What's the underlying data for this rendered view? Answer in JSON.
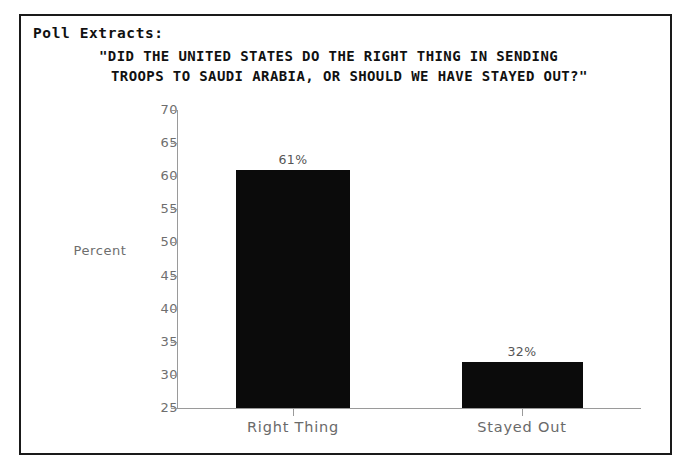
{
  "document": {
    "section_label": "Poll Extracts:",
    "question_line_1": "\"DID THE UNITED STATES DO THE RIGHT THING IN SENDING",
    "question_line_2": "TROOPS TO SAUDI ARABIA, OR SHOULD WE HAVE STAYED OUT?\""
  },
  "chart_data": {
    "type": "bar",
    "title": "\"DID THE UNITED STATES DO THE RIGHT THING IN SENDING TROOPS TO SAUDI ARABIA, OR SHOULD WE HAVE STAYED OUT?\"",
    "categories": [
      "Right Thing",
      "Stayed Out"
    ],
    "values": [
      61,
      32
    ],
    "data_labels": [
      "61%",
      "32%"
    ],
    "xlabel": "",
    "ylabel": "Percent",
    "ylim": [
      25,
      70
    ],
    "yticks": [
      25,
      30,
      35,
      40,
      45,
      50,
      55,
      60,
      65,
      70
    ],
    "ytick_labels": [
      "25",
      "30",
      "35",
      "40",
      "45",
      "50",
      "55",
      "60",
      "65",
      "70"
    ],
    "grid": false,
    "legend": false,
    "bar_color": "#0b0b0b",
    "axis_color": "#9a9a9a",
    "label_color": "#6a6a6a"
  }
}
